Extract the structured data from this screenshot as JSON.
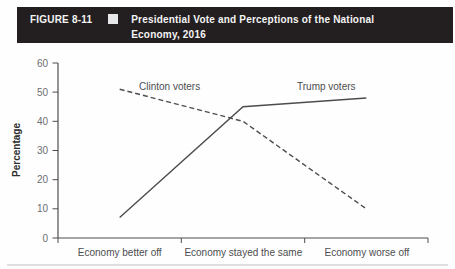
{
  "figure_header": {
    "label": "FIGURE 8-11",
    "bullet_icon": "square-bullet",
    "title_line1": "Presidential Vote and Perceptions of the National",
    "title_line2": "Economy, 2016",
    "bg_color": "#231f20",
    "text_color": "#f4f4f4"
  },
  "chart_data": {
    "type": "line",
    "title": "Presidential Vote and Perceptions of the National Economy, 2016",
    "categories": [
      "Economy better off",
      "Economy stayed the same",
      "Economy worse off"
    ],
    "series": [
      {
        "name": "Clinton voters",
        "values": [
          51,
          40,
          10
        ],
        "style": "dashed",
        "color": "#4d4d4f"
      },
      {
        "name": "Trump voters",
        "values": [
          7,
          45,
          48
        ],
        "style": "solid",
        "color": "#4d4d4f"
      }
    ],
    "xlabel": "",
    "ylabel": "Percentage",
    "ylim": [
      0,
      60
    ],
    "yticks": [
      0,
      10,
      20,
      30,
      40,
      50,
      60
    ],
    "grid": false,
    "legend_position": "inline-annotations",
    "axis_color": "#4d4d4f",
    "bottom_rule_color": "#d1d3d4"
  }
}
